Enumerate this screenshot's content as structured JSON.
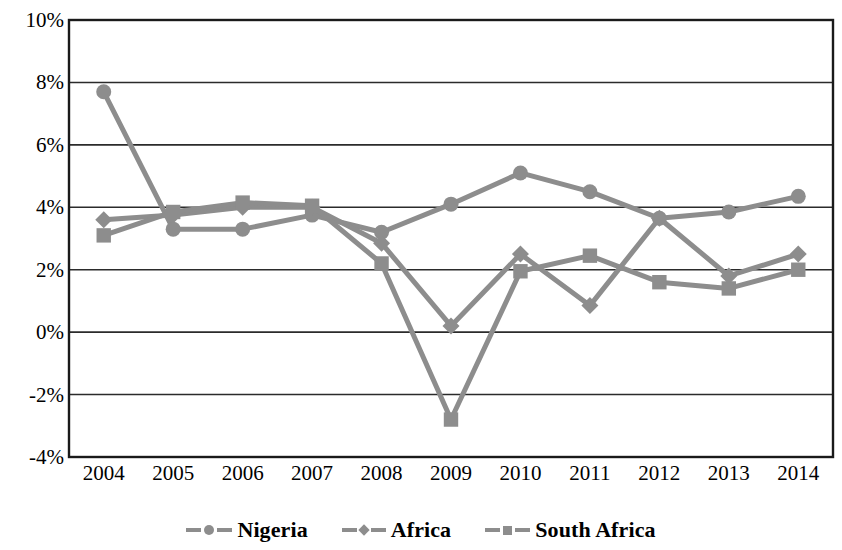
{
  "chart_data": {
    "type": "line",
    "title": "",
    "xlabel": "",
    "ylabel": "",
    "categories": [
      "2004",
      "2005",
      "2006",
      "2007",
      "2008",
      "2009",
      "2010",
      "2011",
      "2012",
      "2013",
      "2014"
    ],
    "ylim": [
      -4,
      10
    ],
    "ytick_labels": [
      "10%",
      "8%",
      "6%",
      "4%",
      "2%",
      "0%",
      "-2%",
      "-4%"
    ],
    "ytick_values": [
      10,
      8,
      6,
      4,
      2,
      0,
      -2,
      -4
    ],
    "grid": true,
    "legend_position": "bottom",
    "series": [
      {
        "name": "Nigeria",
        "marker": "circle",
        "color": "#8d8d8d",
        "values": [
          7.7,
          3.3,
          3.3,
          3.75,
          3.2,
          4.1,
          5.1,
          4.5,
          3.65,
          3.85,
          4.35
        ]
      },
      {
        "name": "Africa",
        "marker": "diamond",
        "color": "#8d8d8d",
        "values": [
          3.6,
          3.75,
          4.0,
          4.0,
          2.85,
          0.2,
          2.5,
          0.85,
          3.65,
          1.8,
          2.5
        ]
      },
      {
        "name": "South Africa",
        "marker": "square",
        "color": "#8d8d8d",
        "values": [
          3.1,
          3.85,
          4.15,
          4.05,
          2.2,
          -2.8,
          1.95,
          2.45,
          1.6,
          1.4,
          2.0
        ]
      }
    ]
  },
  "axes": {
    "plot_left": 69,
    "plot_right": 833,
    "plot_top": 20,
    "plot_bottom": 457,
    "frame_color": "#1a1a1a",
    "gridline_color": "#2b2b2b"
  },
  "legend": {
    "items": [
      {
        "label": "Nigeria",
        "marker": "circle"
      },
      {
        "label": "Africa",
        "marker": "diamond"
      },
      {
        "label": "South Africa",
        "marker": "square"
      }
    ]
  }
}
